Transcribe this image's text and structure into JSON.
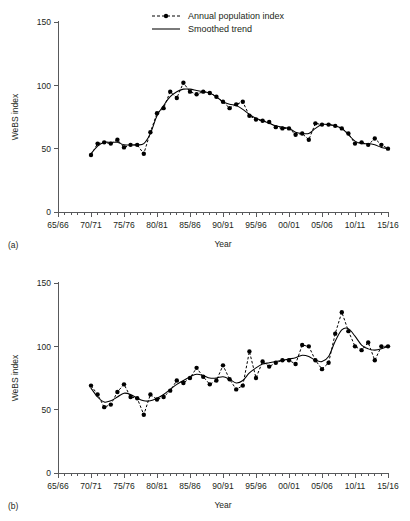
{
  "figure": {
    "panels": [
      {
        "letter": "(a)",
        "ylabel": "WeBS index",
        "xlabel": "Year",
        "legend": {
          "position": "top-center",
          "entries": [
            {
              "label": "Annual population index",
              "style": "dashed-marker"
            },
            {
              "label": "Smoothed trend",
              "style": "solid-line"
            }
          ]
        }
      },
      {
        "letter": "(b)",
        "ylabel": "WeBS index",
        "xlabel": "Year",
        "legend": {
          "position": "none",
          "entries": []
        }
      }
    ]
  },
  "chart_data": [
    {
      "type": "line",
      "panel": "(a)",
      "title": "",
      "xlabel": "Year",
      "ylabel": "WeBS index",
      "ylim": [
        0,
        150
      ],
      "yticks": [
        0,
        50,
        100,
        150
      ],
      "ytick_labels": [
        "0",
        "50",
        "100",
        "150"
      ],
      "xlim": [
        1965,
        2015
      ],
      "xticks": [
        1965,
        1970,
        1975,
        1980,
        1985,
        1990,
        1995,
        2000,
        2005,
        2010,
        2015
      ],
      "xtick_labels": [
        "65/66",
        "70/71",
        "75/76",
        "80/81",
        "85/86",
        "90/91",
        "95/96",
        "00/01",
        "05/06",
        "10/11",
        "15/16"
      ],
      "xtick_minor_step": 1,
      "grid": false,
      "legend_position": "top-center",
      "x": [
        1970,
        1971,
        1972,
        1973,
        1974,
        1975,
        1976,
        1977,
        1978,
        1979,
        1980,
        1981,
        1982,
        1983,
        1984,
        1985,
        1986,
        1987,
        1988,
        1989,
        1990,
        1991,
        1992,
        1993,
        1994,
        1995,
        1996,
        1997,
        1998,
        1999,
        2000,
        2001,
        2002,
        2003,
        2004,
        2005,
        2006,
        2007,
        2008,
        2009,
        2010,
        2011,
        2012,
        2013
      ],
      "series": [
        {
          "name": "Annual population index",
          "style": "dashed-marker",
          "values": [
            45,
            54,
            55,
            54,
            57,
            51,
            53,
            53,
            46,
            63,
            78,
            82,
            95,
            90,
            102,
            95,
            93,
            95,
            94,
            91,
            87,
            82,
            85,
            87,
            76,
            73,
            72,
            71,
            67,
            66,
            66,
            61,
            62,
            57,
            70,
            69,
            69,
            68,
            66,
            62,
            54,
            55,
            53,
            58,
            53,
            50
          ]
        },
        {
          "name": "Smoothed trend",
          "style": "solid-line",
          "values": [
            46,
            52,
            55,
            55,
            55,
            53,
            53,
            53,
            54,
            62,
            76,
            84,
            91,
            95,
            97,
            97,
            96,
            95,
            94,
            91,
            87,
            85,
            84,
            81,
            77,
            74,
            72,
            70,
            68,
            67,
            66,
            63,
            62,
            62,
            66,
            69,
            69,
            68,
            66,
            61,
            56,
            54,
            54,
            53,
            51,
            50
          ]
        }
      ]
    },
    {
      "type": "line",
      "panel": "(b)",
      "title": "",
      "xlabel": "Year",
      "ylabel": "WeBS index",
      "ylim": [
        0,
        150
      ],
      "yticks": [
        0,
        50,
        100,
        150
      ],
      "ytick_labels": [
        "0",
        "50",
        "100",
        "150"
      ],
      "xlim": [
        1965,
        2015
      ],
      "xticks": [
        1965,
        1970,
        1975,
        1980,
        1985,
        1990,
        1995,
        2000,
        2005,
        2010,
        2015
      ],
      "xtick_labels": [
        "65/66",
        "70/71",
        "75/76",
        "80/81",
        "85/86",
        "90/91",
        "95/96",
        "00/01",
        "05/06",
        "10/11",
        "15/16"
      ],
      "xtick_minor_step": 1,
      "grid": false,
      "legend_position": "none",
      "x": [
        1970,
        1971,
        1972,
        1973,
        1974,
        1975,
        1976,
        1977,
        1978,
        1979,
        1980,
        1981,
        1982,
        1983,
        1984,
        1985,
        1986,
        1987,
        1988,
        1989,
        1990,
        1991,
        1992,
        1993,
        1994,
        1995,
        1996,
        1997,
        1998,
        1999,
        2000,
        2001,
        2002,
        2003,
        2004,
        2005,
        2006,
        2007,
        2008,
        2009,
        2010,
        2011,
        2012,
        2013
      ],
      "series": [
        {
          "name": "Annual population index",
          "style": "dashed-marker",
          "values": [
            69,
            62,
            52,
            54,
            64,
            70,
            60,
            59,
            46,
            62,
            58,
            60,
            65,
            73,
            71,
            75,
            83,
            76,
            70,
            73,
            85,
            74,
            66,
            69,
            96,
            75,
            88,
            84,
            87,
            89,
            89,
            86,
            101,
            100,
            89,
            82,
            87,
            110,
            127,
            112,
            100,
            97,
            103,
            89,
            100,
            100
          ]
        },
        {
          "name": "Smoothed trend",
          "style": "solid-line",
          "values": [
            67,
            60,
            56,
            57,
            60,
            63,
            62,
            59,
            57,
            57,
            59,
            62,
            66,
            70,
            73,
            76,
            78,
            77,
            75,
            75,
            76,
            74,
            71,
            73,
            79,
            83,
            86,
            87,
            88,
            89,
            90,
            91,
            93,
            92,
            89,
            88,
            92,
            104,
            113,
            114,
            108,
            101,
            98,
            97,
            98,
            100
          ]
        }
      ]
    }
  ]
}
